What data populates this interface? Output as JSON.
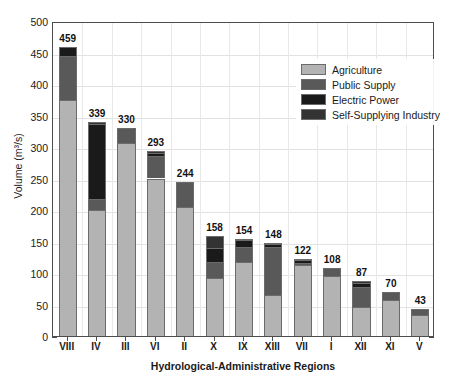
{
  "chart_data": {
    "type": "bar",
    "stacked": true,
    "title": "",
    "xlabel": "Hydrological-Administrative Regions",
    "ylabel": "Volume (m³/s)",
    "ylim": [
      0,
      500
    ],
    "yticks": [
      0,
      50,
      100,
      150,
      200,
      250,
      300,
      350,
      400,
      450,
      500
    ],
    "grid": true,
    "legend_position": "upper right",
    "categories": [
      "VIII",
      "IV",
      "III",
      "VI",
      "II",
      "X",
      "IX",
      "XIII",
      "VII",
      "I",
      "XII",
      "XI",
      "V"
    ],
    "totals": [
      459,
      339,
      330,
      293,
      244,
      158,
      154,
      148,
      122,
      108,
      87,
      70,
      43
    ],
    "series": [
      {
        "name": "Agriculture",
        "color": "#b3b3b3",
        "values": [
          375,
          200,
          306,
          250,
          205,
          92,
          118,
          65,
          112,
          95,
          46,
          57,
          34
        ]
      },
      {
        "name": "Public Supply",
        "color": "#595959",
        "values": [
          69,
          18,
          24,
          36,
          39,
          26,
          24,
          77,
          4,
          13,
          32,
          13,
          9
        ]
      },
      {
        "name": "Electric Power",
        "color": "#1a1a1a",
        "values": [
          15,
          118,
          0,
          5,
          0,
          22,
          10,
          4,
          5,
          0,
          6,
          0,
          0
        ]
      },
      {
        "name": "Self-Supplying Industry",
        "color": "#333333",
        "values": [
          0,
          3,
          0,
          2,
          0,
          18,
          2,
          2,
          1,
          0,
          3,
          0,
          0
        ]
      }
    ]
  },
  "legend": {
    "items": [
      {
        "label": "Agriculture",
        "color": "#b3b3b3"
      },
      {
        "label": "Public Supply",
        "color": "#595959"
      },
      {
        "label": "Electric Power",
        "color": "#1a1a1a"
      },
      {
        "label": "Self-Supplying Industry",
        "color": "#333333"
      }
    ]
  },
  "axes": {
    "y_label": "Volume (m³/s)",
    "x_label": "Hydrological-Administrative Regions",
    "y_tick_labels": [
      "0",
      "50",
      "100",
      "150",
      "200",
      "250",
      "300",
      "350",
      "400",
      "450",
      "500"
    ]
  },
  "caption_artifact": ""
}
